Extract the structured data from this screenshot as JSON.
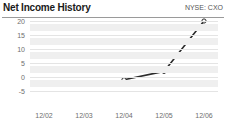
{
  "header": {
    "title": "Net Income History",
    "ticker": "NYSE: CXO"
  },
  "chart_data": {
    "type": "line",
    "title": "Net Income History",
    "subtitle": "NYSE: CXO",
    "xlabel": "",
    "ylabel": "",
    "categories": [
      "12/02",
      "12/03",
      "12/04",
      "12/05",
      "12/06"
    ],
    "series": [
      {
        "name": "Net Income",
        "values": [
          null,
          null,
          -1,
          2,
          20
        ]
      }
    ],
    "yticks": [
      20,
      15,
      10,
      5,
      0,
      -5
    ],
    "ylim": [
      -5,
      20
    ],
    "grid": true,
    "legend": "none",
    "marker": "open-circle",
    "line_color": "#2b2b2b",
    "band_color": "#efefef"
  },
  "yticklabels": [
    "20",
    "15",
    "10",
    "5",
    "0",
    "-5"
  ],
  "xticklabels": [
    "12/02",
    "12/03",
    "12/04",
    "12/05",
    "12/06"
  ]
}
